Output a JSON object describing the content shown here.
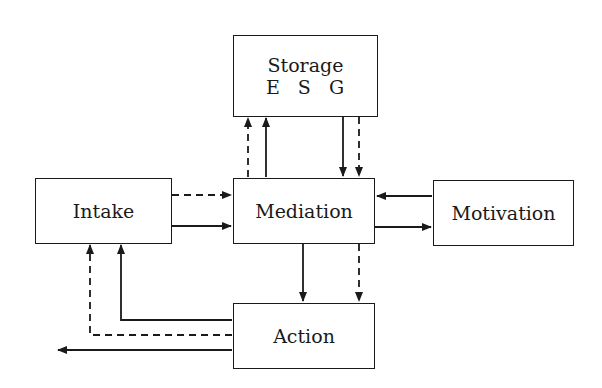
{
  "diagram": {
    "nodes": {
      "storage": {
        "label": "Storage",
        "sublabel": "E S G"
      },
      "intake": {
        "label": "Intake"
      },
      "mediation": {
        "label": "Mediation"
      },
      "motivation": {
        "label": "Motivation"
      },
      "action": {
        "label": "Action"
      }
    },
    "edges": [
      {
        "from": "intake",
        "to": "mediation",
        "style": "dashed"
      },
      {
        "from": "intake",
        "to": "mediation",
        "style": "solid"
      },
      {
        "from": "mediation",
        "to": "storage",
        "style": "dashed"
      },
      {
        "from": "mediation",
        "to": "storage",
        "style": "solid"
      },
      {
        "from": "storage",
        "to": "mediation",
        "style": "solid"
      },
      {
        "from": "storage",
        "to": "mediation",
        "style": "dashed"
      },
      {
        "from": "motivation",
        "to": "mediation",
        "style": "solid"
      },
      {
        "from": "mediation",
        "to": "motivation",
        "style": "solid"
      },
      {
        "from": "mediation",
        "to": "action",
        "style": "solid"
      },
      {
        "from": "mediation",
        "to": "action",
        "style": "dashed"
      },
      {
        "from": "action",
        "to": "intake",
        "style": "solid"
      },
      {
        "from": "action",
        "to": "intake",
        "style": "dashed"
      },
      {
        "from": "action",
        "to": "output",
        "style": "solid"
      }
    ],
    "colors": {
      "line": "#1a1a1a",
      "background": "#ffffff"
    }
  }
}
